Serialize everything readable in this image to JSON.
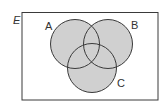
{
  "diagram": {
    "type": "venn",
    "universal_set_label": "E",
    "sets": [
      {
        "label": "A",
        "cx": 75,
        "cy": 44,
        "r": 24.5,
        "label_x": 46,
        "label_y": 29
      },
      {
        "label": "B",
        "cx": 108,
        "cy": 44,
        "r": 24.5,
        "label_x": 131,
        "label_y": 28
      },
      {
        "label": "C",
        "cx": 92,
        "cy": 68,
        "r": 24.5,
        "label_x": 117,
        "label_y": 86
      }
    ],
    "shaded_region": "A ∪ B ∪ C",
    "colors": {
      "fill": "#d0d0d0",
      "stroke": "#3a3a3a",
      "background": "#ffffff"
    }
  }
}
